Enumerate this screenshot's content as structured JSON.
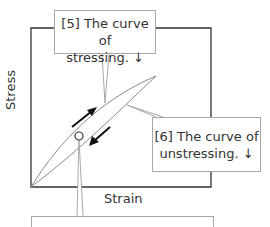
{
  "diagram": {
    "axes": {
      "x_label": "Strain",
      "y_label": "Stress"
    },
    "callouts": [
      {
        "id": "5",
        "line1": "[5] The curve of",
        "line2": "stressing. ↓"
      },
      {
        "id": "6",
        "line1": "[6] The curve of",
        "line2": "unstressing. ↓"
      },
      {
        "id": "7",
        "line1": "",
        "line2": ""
      }
    ],
    "arrows": {
      "upper": "arrow-up-right",
      "lower": "arrow-down-left"
    },
    "colors": {
      "frame": "#333333",
      "curve": "#8a8a8a",
      "callout_border": "#a8a8a8",
      "arrow": "#111111"
    }
  }
}
